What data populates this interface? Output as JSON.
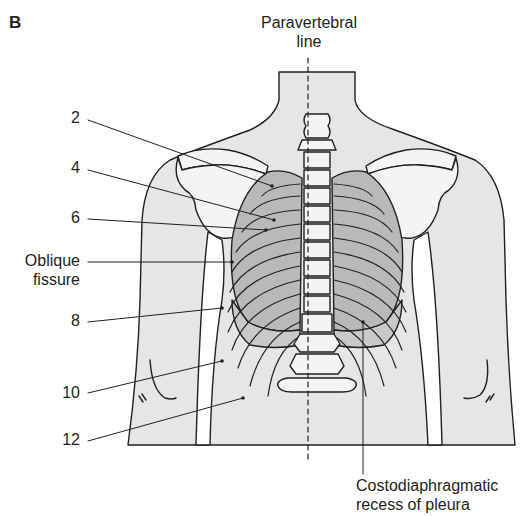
{
  "figure": {
    "panel_label": "B",
    "colors": {
      "skin": "#e6e6e6",
      "bone": "#f4f4f4",
      "lung": "#b9b9b9",
      "pleura": "#cfcfcf",
      "outline": "#231f20",
      "background": "#ffffff"
    }
  },
  "labels": {
    "paravertebral_line": [
      "Paravertebral",
      "line"
    ],
    "rib_2": "2",
    "rib_4": "4",
    "rib_6": "6",
    "oblique_fissure": [
      "Oblique",
      "fissure"
    ],
    "rib_8": "8",
    "rib_10": "10",
    "rib_12": "12",
    "costodiaphragmatic_recess": [
      "Costodiaphragmatic",
      "recess of pleura"
    ]
  }
}
